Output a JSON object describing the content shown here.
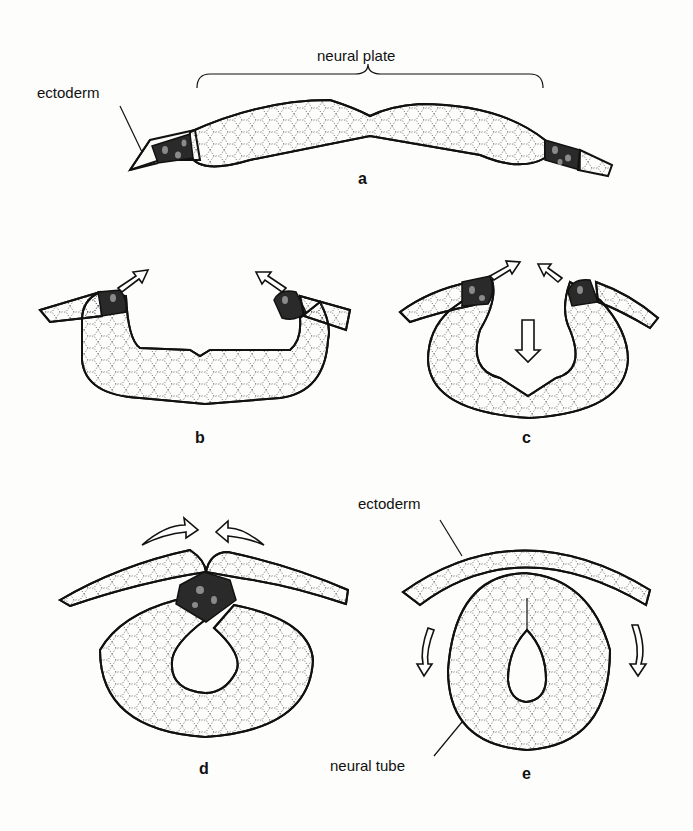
{
  "figure": {
    "panels": [
      {
        "id": "a",
        "label": "a",
        "labels": [
          "neural plate",
          "ectoderm"
        ]
      },
      {
        "id": "b",
        "label": "b",
        "labels": []
      },
      {
        "id": "c",
        "label": "c",
        "labels": []
      },
      {
        "id": "d",
        "label": "d",
        "labels": []
      },
      {
        "id": "e",
        "label": "e",
        "labels": [
          "ectoderm",
          "neural tube"
        ]
      }
    ]
  },
  "labels": {
    "neural_plate": "neural plate",
    "ectoderm_a": "ectoderm",
    "ectoderm_e": "ectoderm",
    "neural_tube": "neural tube"
  },
  "panel_letters": {
    "a": "a",
    "b": "b",
    "c": "c",
    "d": "d",
    "e": "e"
  },
  "colors": {
    "outline": "#111111",
    "tissue_fill": "#fbfbf8",
    "neural_crest": "#2a2a2a",
    "background": "#fdfdfb"
  }
}
